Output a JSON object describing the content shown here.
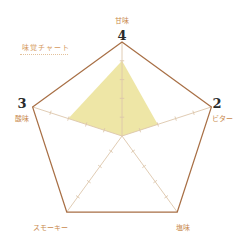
{
  "chart_data": {
    "type": "radar",
    "title": "味覚チャート",
    "max": 5,
    "ticks": 5,
    "axes": [
      {
        "label": "甘味",
        "value": 4,
        "display_value": "4"
      },
      {
        "label": "ビター",
        "value": 2,
        "display_value": "2"
      },
      {
        "label": "塩味",
        "value": 0,
        "display_value": ""
      },
      {
        "label": "スモーキー",
        "value": 0,
        "display_value": ""
      },
      {
        "label": "酸味",
        "value": 3,
        "display_value": "3"
      }
    ],
    "colors": {
      "outline": "#a86f45",
      "axis": "#dcc6ab",
      "fill": "#eee6a6",
      "label": "#c98a4e",
      "number": "#2b2b2b"
    }
  }
}
